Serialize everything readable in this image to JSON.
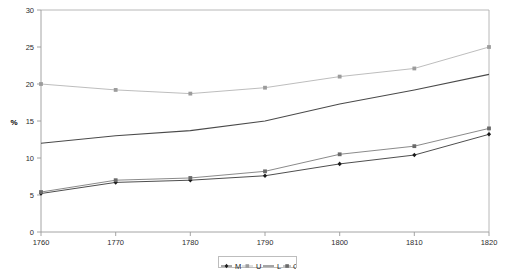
{
  "chart_data": {
    "type": "line",
    "title": "",
    "xlabel": "",
    "ylabel": "%",
    "x": [
      1760,
      1770,
      1780,
      1790,
      1800,
      1810,
      1820
    ],
    "xticklabels": [
      "1760",
      "1770",
      "1780",
      "1790",
      "1800",
      "1810",
      "1820"
    ],
    "yticklabels": [
      "0",
      "5",
      "10",
      "15",
      "20",
      "25",
      "30"
    ],
    "yticks": [
      0,
      5,
      10,
      15,
      20,
      25,
      30
    ],
    "xlim": [
      1760,
      1820
    ],
    "ylim": [
      0,
      30
    ],
    "grid": false,
    "legend_position": "bottom-center",
    "series": [
      {
        "name": "M",
        "color": "#3a3a3a",
        "marker": "diamond",
        "values": [
          5.2,
          6.7,
          7.0,
          7.6,
          9.2,
          10.4,
          13.2
        ]
      },
      {
        "name": "U",
        "color": "#b5b5b5",
        "marker": "square",
        "values": [
          20.0,
          19.2,
          18.7,
          19.5,
          21.0,
          22.1,
          25.0
        ]
      },
      {
        "name": "L",
        "color": "#4a4a4a",
        "marker": "none",
        "values": [
          12.0,
          13.0,
          13.7,
          15.0,
          17.3,
          19.2,
          21.3
        ]
      },
      {
        "name": "C",
        "color": "#7d7d7d",
        "marker": "square",
        "values": [
          5.4,
          7.0,
          7.3,
          8.2,
          10.5,
          11.6,
          14.0
        ]
      }
    ]
  },
  "legend": {
    "entries": [
      "M",
      "U",
      "L",
      "C"
    ]
  },
  "colors": {
    "axis": "#9a9a9a",
    "text": "#2b2b2b",
    "background": "#ffffff"
  }
}
